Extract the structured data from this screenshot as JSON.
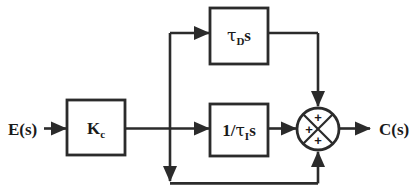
{
  "diagram": {
    "type": "control-system-block-diagram",
    "line_color": "#2b2b2b",
    "text_color": "#1a1a1a",
    "background": "#ffffff",
    "input": {
      "label": "E(s)",
      "name": "error-signal"
    },
    "output": {
      "label": "C(s)",
      "name": "controller-output-signal"
    },
    "blocks": [
      {
        "id": "gain",
        "name": "proportional-gain-block",
        "label_main": "K",
        "label_sub": "c",
        "label_full": "Kc",
        "x": 67,
        "y": 100,
        "w": 58,
        "h": 55
      },
      {
        "id": "derivative",
        "name": "derivative-block",
        "label_prefix": "",
        "label_tau": "τ",
        "label_sub": "D",
        "label_suffix": "s",
        "label_full": "τD s",
        "x": 210,
        "y": 8,
        "w": 58,
        "h": 56
      },
      {
        "id": "integral",
        "name": "integral-block",
        "label_prefix": "1/",
        "label_tau": "τ",
        "label_sub": "I",
        "label_suffix": "s",
        "label_full": "1/τI s",
        "x": 210,
        "y": 104,
        "w": 58,
        "h": 52
      }
    ],
    "summing_junction": {
      "name": "summing-junction",
      "cx": 318,
      "cy": 129,
      "r": 21,
      "signs": [
        {
          "position": "top",
          "symbol": "+"
        },
        {
          "position": "left",
          "symbol": "+"
        },
        {
          "position": "bottom",
          "symbol": "+"
        }
      ]
    },
    "branch_node": {
      "x": 170,
      "y": 129
    },
    "paths": [
      {
        "name": "input-to-gain",
        "desc": "E(s) into Kc block"
      },
      {
        "name": "gain-to-branch",
        "desc": "Kc output to branch node"
      },
      {
        "name": "branch-to-derivative",
        "desc": "branch up and right into derivative block"
      },
      {
        "name": "branch-to-integral",
        "desc": "branch right into integral block"
      },
      {
        "name": "branch-to-feedforward",
        "desc": "branch down to bottom bus"
      },
      {
        "name": "derivative-to-sum",
        "desc": "derivative output right then down into sum top"
      },
      {
        "name": "integral-to-sum",
        "desc": "integral output right into sum left"
      },
      {
        "name": "proportional-to-sum",
        "desc": "bottom bus right then up into sum bottom"
      },
      {
        "name": "sum-to-output",
        "desc": "sum output right to C(s)"
      }
    ]
  }
}
